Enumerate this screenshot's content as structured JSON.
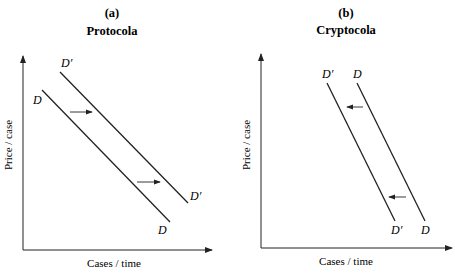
{
  "panels": [
    {
      "id": "a",
      "letter": "(a)",
      "title": "Protocola",
      "ylabel": "Price / case",
      "xlabel": "Cases / time",
      "curves": [
        {
          "name": "D",
          "top_label": "D",
          "bottom_label": "D"
        },
        {
          "name": "D'",
          "top_label": "D′",
          "bottom_label": "D′"
        }
      ],
      "shift_direction": "right"
    },
    {
      "id": "b",
      "letter": "(b)",
      "title": "Cryptocola",
      "ylabel": "Price / case",
      "xlabel": "Cases / time",
      "curves": [
        {
          "name": "D'",
          "top_label": "D′",
          "bottom_label": "D′"
        },
        {
          "name": "D",
          "top_label": "D",
          "bottom_label": "D"
        }
      ],
      "shift_direction": "left"
    }
  ],
  "colors": {
    "line": "#222222",
    "background": "#ffffff"
  }
}
